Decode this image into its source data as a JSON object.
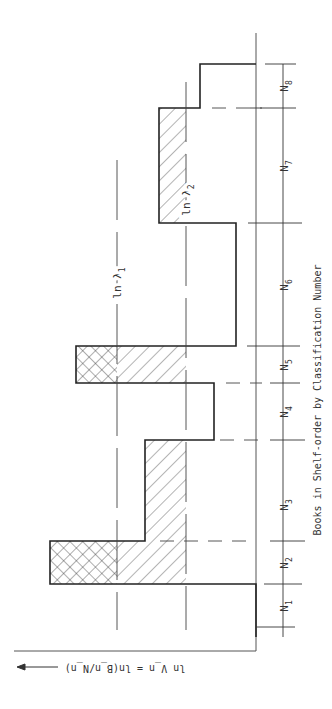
{
  "diagram": {
    "x_axis_label": "Books in Shelf-order by Classification Number",
    "y_axis_label": "ln V_n = ln(B_n/N_n)",
    "reference_levels": [
      {
        "label": "ln λ1",
        "main": "ln λ",
        "sub": "1"
      },
      {
        "label": "ln λ2",
        "main": "ln λ",
        "sub": "2"
      }
    ],
    "segments": [
      {
        "label": "N1",
        "main": "N",
        "sub": "1"
      },
      {
        "label": "N2",
        "main": "N",
        "sub": "2"
      },
      {
        "label": "N3",
        "main": "N",
        "sub": "3"
      },
      {
        "label": "N4",
        "main": "N",
        "sub": "4"
      },
      {
        "label": "N5",
        "main": "N",
        "sub": "5"
      },
      {
        "label": "N6",
        "main": "N",
        "sub": "6"
      },
      {
        "label": "N7",
        "main": "N",
        "sub": "7"
      },
      {
        "label": "N8",
        "main": "N",
        "sub": "8"
      }
    ],
    "hatching_legend": {
      "crosshatch": "above ln λ1",
      "single_hatch": "between ln λ1 and ln λ2"
    }
  }
}
